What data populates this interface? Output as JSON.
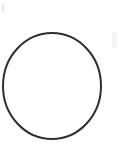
{
  "canvas": {
    "width": 124,
    "height": 156,
    "background_color": "#ffffff",
    "label": "Scanned drawing canvas"
  },
  "figure": {
    "name": "circle-outline",
    "shape": "circle",
    "stroke_color": "#2e2e33",
    "fill": "none",
    "stroke_width": 2,
    "center_x": 52,
    "center_y": 86,
    "radius_x": 49,
    "radius_y": 53,
    "bounds": {
      "left": 3,
      "top": 33,
      "right": 101,
      "bottom": 139
    }
  },
  "artifacts": [
    {
      "name": "smudge-top-left",
      "color": "#f2f2f4",
      "x": 1,
      "y": 3,
      "width": 4,
      "height": 10
    },
    {
      "name": "smudge-right",
      "color": "#f4f4f6",
      "x": 112,
      "y": 33,
      "width": 5,
      "height": 15
    }
  ],
  "alt_text": "A single thin dark circle outline centered on a blank white page"
}
